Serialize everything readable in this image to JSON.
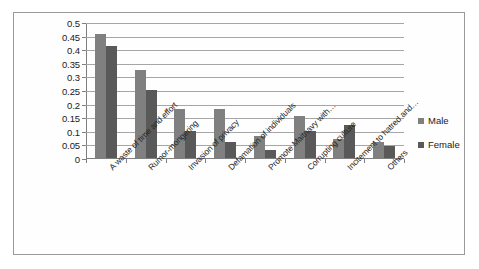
{
  "chart_data": {
    "type": "bar",
    "title": "",
    "subtitle": "",
    "xlabel": "",
    "ylabel": "",
    "ylim": [
      0,
      0.5
    ],
    "grid": true,
    "legend_position": "right",
    "categories": [
      "A waste of time and effort",
      "Rumor-mongering",
      "Invasion of privacy",
      "Defamation of individuals",
      "Promote Maitnavy with…",
      "Corrupting culture",
      "Incitement to hatred and…",
      "Others"
    ],
    "series": [
      {
        "name": "Male",
        "color": "#808080",
        "values": [
          0.455,
          0.325,
          0.18,
          0.18,
          0.08,
          0.155,
          0.07,
          0.06
        ]
      },
      {
        "name": "Female",
        "color": "#595959",
        "values": [
          0.41,
          0.25,
          0.1,
          0.06,
          0.03,
          0.1,
          0.12,
          0.045
        ]
      }
    ],
    "y_ticks": [
      {
        "value": 0.5,
        "label": "0.5"
      },
      {
        "value": 0.45,
        "label": "0.45"
      },
      {
        "value": 0.4,
        "label": "0.4"
      },
      {
        "value": 0.35,
        "label": "0.35"
      },
      {
        "value": 0.3,
        "label": "0.3"
      },
      {
        "value": 0.25,
        "label": "0.25"
      },
      {
        "value": 0.2,
        "label": "0.2"
      },
      {
        "value": 0.15,
        "label": "0.15"
      },
      {
        "value": 0.1,
        "label": "0.1"
      },
      {
        "value": 0.05,
        "label": "0.05"
      },
      {
        "value": 0.0,
        "label": "0"
      }
    ]
  },
  "legend": {
    "items": [
      {
        "label": "Male",
        "marker": "square-swatch-icon",
        "color": "#808080"
      },
      {
        "label": "Female",
        "marker": "square-swatch-icon",
        "color": "#595959"
      }
    ]
  }
}
